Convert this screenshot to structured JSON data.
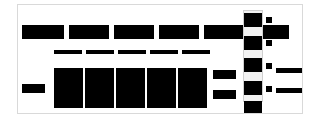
{
  "canvas": {
    "width": 321,
    "height": 120,
    "background": "#ffffff",
    "description": "Fully redacted document-style UI screenshot"
  },
  "frame": {
    "name": "page-frame",
    "border_color": "#d9d9d9",
    "background": "#ffffff",
    "x": 17,
    "y": 4,
    "width": 286,
    "height": 110
  },
  "redaction_color": "#000000",
  "header_row": {
    "label": "",
    "count": 6,
    "blocks": [
      {
        "x": 22,
        "y": 25,
        "width": 42,
        "height": 14,
        "label": ""
      },
      {
        "x": 69,
        "y": 25,
        "width": 40,
        "height": 14,
        "label": ""
      },
      {
        "x": 114,
        "y": 25,
        "width": 40,
        "height": 14,
        "label": ""
      },
      {
        "x": 159,
        "y": 25,
        "width": 40,
        "height": 14,
        "label": ""
      },
      {
        "x": 204,
        "y": 25,
        "width": 40,
        "height": 14,
        "label": ""
      },
      {
        "x": 249,
        "y": 25,
        "width": 40,
        "height": 14,
        "label": ""
      }
    ]
  },
  "subtitle_row": {
    "label": "",
    "count": 5,
    "blocks": [
      {
        "x": 54,
        "y": 50,
        "width": 28,
        "height": 4,
        "label": ""
      },
      {
        "x": 86,
        "y": 50,
        "width": 28,
        "height": 4,
        "label": ""
      },
      {
        "x": 118,
        "y": 50,
        "width": 28,
        "height": 4,
        "label": ""
      },
      {
        "x": 150,
        "y": 50,
        "width": 28,
        "height": 4,
        "label": ""
      },
      {
        "x": 182,
        "y": 50,
        "width": 28,
        "height": 4,
        "label": ""
      }
    ]
  },
  "content_row": {
    "label": "",
    "count": 5,
    "blocks": [
      {
        "x": 54,
        "y": 68,
        "width": 29,
        "height": 40,
        "label": ""
      },
      {
        "x": 85,
        "y": 68,
        "width": 29,
        "height": 40,
        "label": ""
      },
      {
        "x": 116,
        "y": 68,
        "width": 29,
        "height": 40,
        "label": ""
      },
      {
        "x": 147,
        "y": 68,
        "width": 29,
        "height": 40,
        "label": ""
      },
      {
        "x": 178,
        "y": 68,
        "width": 29,
        "height": 40,
        "label": ""
      }
    ]
  },
  "row_label": {
    "name": "row-label-redaction",
    "x": 22,
    "y": 84,
    "width": 23,
    "height": 9,
    "label": ""
  },
  "value_boxes": {
    "label": "",
    "count": 2,
    "blocks": [
      {
        "x": 213,
        "y": 70,
        "width": 23,
        "height": 9,
        "label": ""
      },
      {
        "x": 213,
        "y": 90,
        "width": 23,
        "height": 9,
        "label": ""
      }
    ]
  },
  "sidebar": {
    "name": "sidebar-track",
    "track_color": "#f2f2f2",
    "track_border": "#cfcfcf",
    "x": 243,
    "y": 10,
    "width": 20,
    "height": 92,
    "items": [
      {
        "x": 244,
        "y": 13,
        "width": 18,
        "height": 14,
        "label": ""
      },
      {
        "x": 244,
        "y": 36,
        "width": 18,
        "height": 14,
        "label": ""
      },
      {
        "x": 244,
        "y": 58,
        "width": 18,
        "height": 14,
        "label": ""
      },
      {
        "x": 244,
        "y": 81,
        "width": 18,
        "height": 14,
        "label": ""
      },
      {
        "x": 244,
        "y": 101,
        "width": 18,
        "height": 12,
        "label": ""
      }
    ]
  },
  "markers": {
    "label": "",
    "count": 4,
    "items": [
      {
        "x": 266,
        "y": 17,
        "width": 6,
        "height": 6,
        "bar": null
      },
      {
        "x": 266,
        "y": 40,
        "width": 6,
        "height": 6,
        "bar": null
      },
      {
        "x": 266,
        "y": 63,
        "width": 6,
        "height": 6,
        "bar": {
          "x": 276,
          "y": 68,
          "width": 26,
          "height": 5
        }
      },
      {
        "x": 266,
        "y": 86,
        "width": 6,
        "height": 6,
        "bar": {
          "x": 276,
          "y": 88,
          "width": 26,
          "height": 5
        }
      }
    ]
  }
}
